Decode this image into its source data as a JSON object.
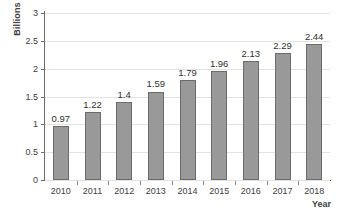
{
  "chart_data": {
    "type": "bar",
    "title": "",
    "subtitle": "",
    "xlabel": "Year",
    "ylabel": "Billions",
    "categories": [
      "2010",
      "2011",
      "2012",
      "2013",
      "2014",
      "2015",
      "2016",
      "2017",
      "2018"
    ],
    "values": [
      0.97,
      1.22,
      1.4,
      1.59,
      1.79,
      1.96,
      2.13,
      2.29,
      2.44
    ],
    "data_labels": [
      "0.97",
      "1.22",
      "1.4",
      "1.59",
      "1.79",
      "1.96",
      "2.13",
      "2.29",
      "2.44"
    ],
    "ylim": [
      0,
      3
    ],
    "ytick_values": [
      0,
      0.5,
      1,
      1.5,
      2,
      2.5,
      3
    ],
    "ytick_labels": [
      "0",
      "0.5",
      "1",
      "1.5",
      "2",
      "2.5",
      "3"
    ],
    "grid": true,
    "grid_axis": "y",
    "legend": false,
    "legend_position": "none",
    "bar_color": "#999999",
    "bar_border_color": "#6b6b6b",
    "grid_color": "#e2e2e2",
    "axis_color": "#6d6d6d",
    "text_color": "#404040",
    "background_color": "#ffffff"
  }
}
